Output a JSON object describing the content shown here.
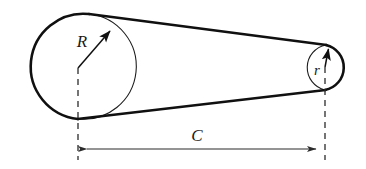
{
  "figure": {
    "type": "engineering-line-diagram",
    "background_color": "#ffffff",
    "stroke_color": "#111111",
    "dimension_color": "#3a3a3a",
    "labels": {
      "large_pulley_radius": "R",
      "small_pulley_radius": "r",
      "center_distance": "C"
    },
    "geometry": {
      "large_pulley": {
        "name": "large-pulley",
        "center_x": 78,
        "center_y": 68,
        "radius": 52
      },
      "small_pulley": {
        "name": "small-pulley",
        "center_x": 325,
        "center_y": 67,
        "radius": 23
      },
      "center_distance_value": 247,
      "belt_top_tangent": {
        "x1": 89,
        "y1": 14,
        "x2": 326,
        "y2": 45
      },
      "belt_bottom_tangent": {
        "x1": 78,
        "y1": 119,
        "x2": 325,
        "y2": 90
      },
      "radius_arrow_R": {
        "x1": 78,
        "y1": 68,
        "x2": 113,
        "y2": 28
      },
      "radius_arrow_r": {
        "x1": 325,
        "y1": 67,
        "x2": 329,
        "y2": 46
      },
      "dimension_line_y": 149,
      "extension_line_left_x": 78,
      "extension_line_right_x": 325
    },
    "label_positions": {
      "R": {
        "x": 82,
        "y": 47
      },
      "r": {
        "x": 314,
        "y": 75
      },
      "C": {
        "x": 197,
        "y": 141
      }
    }
  }
}
